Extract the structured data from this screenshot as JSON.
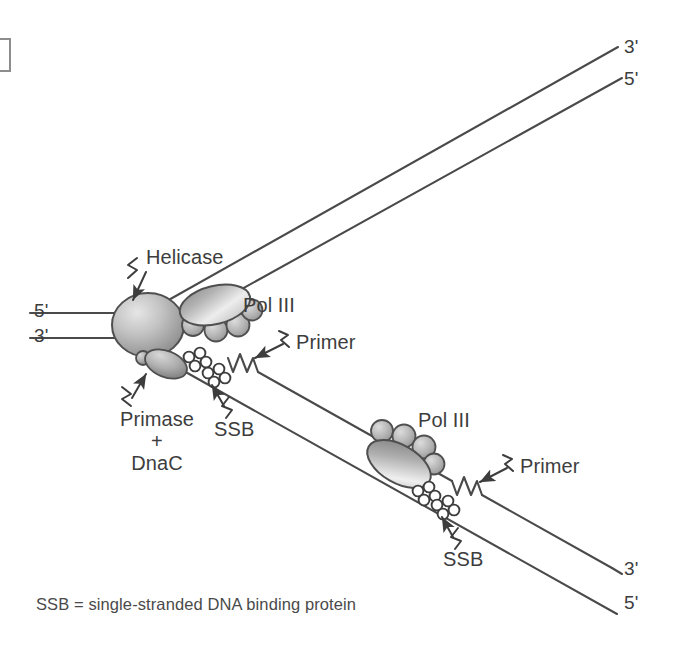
{
  "figure": {
    "background_color": "#ffffff",
    "ink_color": "#3d3d3d",
    "strand_color": "#4a4a4a",
    "protein_fill_light": "#d9d9d9",
    "protein_fill_dark": "#8f8f8f"
  },
  "corner_mark": {
    "name": "crop-bracket",
    "visible": true
  },
  "strand_labels": {
    "parental_top_left": "5'",
    "parental_bottom_left": "3'",
    "leading_top_right_outer": "3'",
    "leading_top_right_inner": "5'",
    "lagging_bottom_right_inner": "3'",
    "lagging_bottom_right_outer": "5'"
  },
  "annotations": {
    "helicase": "Helicase",
    "pol_iii_leading": "Pol III",
    "pol_iii_lagging": "Pol III",
    "primase_line1": "Primase",
    "primase_line2": "+",
    "primase_line3": "DnaC",
    "ssb_upper": "SSB",
    "ssb_lower": "SSB",
    "primer_upper": "Primer",
    "primer_lower": "Primer"
  },
  "footnote": {
    "text": "SSB = single-stranded DNA binding protein"
  },
  "diagram_elements": {
    "helicase_shape": "large-shaded-sphere",
    "primase_shape": "small-shaded-ellipse",
    "pol_iii_shape": "shaded-ellipse-with-four-subunit-circles",
    "ssb_shape": "cluster-of-four-small-circles",
    "primer_shape": "zigzag-sawtooth-segment",
    "leader_shape": "lightning-squiggle-with-arrow"
  }
}
